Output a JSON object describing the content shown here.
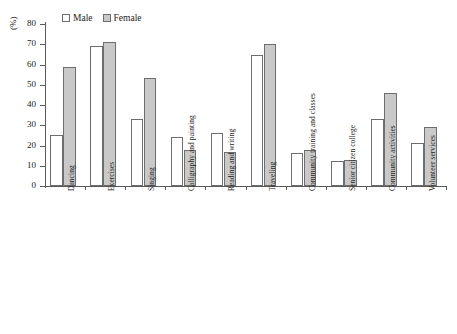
{
  "chart_data": {
    "type": "bar",
    "title": "",
    "xlabel": "",
    "ylabel": "(%)",
    "ylim": [
      0,
      80
    ],
    "ytick_step": 10,
    "yticks": [
      "0",
      "10",
      "20",
      "30",
      "40",
      "50",
      "60",
      "70",
      "80"
    ],
    "grid": false,
    "legend_position": "top-left",
    "categories": [
      "Dancing",
      "Exercises",
      "Singing",
      "Calligraphy and painting",
      "Reading and writing",
      "Traveling",
      "Community training and classes",
      "Senior citizen college",
      "Community activities",
      "Volunteer services"
    ],
    "series": [
      {
        "name": "Male",
        "color": "#ffffff",
        "values": [
          25,
          69,
          33,
          24,
          26,
          64.5,
          16.5,
          12.5,
          33,
          21
        ]
      },
      {
        "name": "Female",
        "color": "#c9c9c9",
        "values": [
          59,
          71,
          53.5,
          18,
          17,
          70,
          18,
          13,
          46,
          29
        ]
      }
    ]
  },
  "legend": {
    "items": [
      {
        "label": "Male",
        "swatch": "male"
      },
      {
        "label": "Female",
        "swatch": "female"
      }
    ]
  },
  "axis": {
    "y_title": "(%)"
  },
  "colors": {
    "male_fill": "#ffffff",
    "female_fill": "#c9c9c9",
    "bar_stroke": "#6e6e6e",
    "axis": "#5a5a5a",
    "text": "#222222",
    "background": "#ffffff"
  }
}
